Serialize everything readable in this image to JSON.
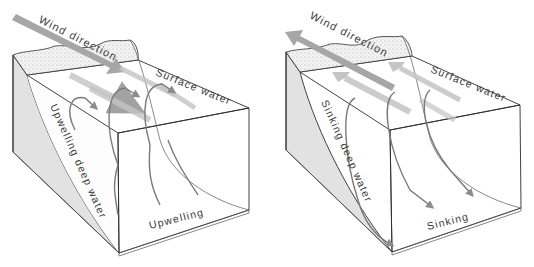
{
  "diagram": {
    "panels": [
      {
        "id": "upwelling",
        "labels": {
          "wind": "Wind direction",
          "surface": "Surface water",
          "deep": "Upwelling deep water",
          "bottom": "Upwelling"
        },
        "wind_arrow_direction": "toward-sea"
      },
      {
        "id": "sinking",
        "labels": {
          "wind": "Wind direction",
          "surface": "Surface water",
          "deep": "Sinking deep water",
          "bottom": "Sinking"
        },
        "wind_arrow_direction": "toward-land"
      }
    ],
    "colors": {
      "outline": "#2e2e2e",
      "arrow_dark": "#8c8c8c",
      "arrow_light": "#c4c4c4",
      "side_shade": "#e2e2e2",
      "curve": "#7a7a7a"
    }
  }
}
